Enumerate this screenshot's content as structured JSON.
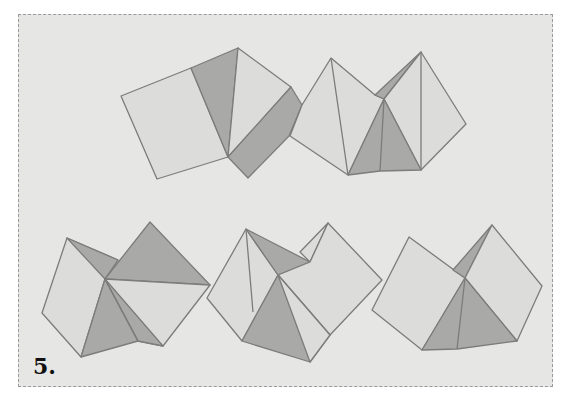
{
  "figure": {
    "label": "5.",
    "colors": {
      "background": "#e6e6e4",
      "paper_light": "#dcdcda",
      "paper_dark": "#a9a9a7",
      "edge": "#7c7c7a",
      "frame_border": "#9a9a9a"
    },
    "units": [
      {
        "id": "unit-1",
        "row": 1,
        "position": "top-left"
      },
      {
        "id": "unit-2",
        "row": 1,
        "position": "top-right"
      },
      {
        "id": "unit-3",
        "row": 2,
        "position": "bottom-left"
      },
      {
        "id": "unit-4",
        "row": 2,
        "position": "bottom-center"
      },
      {
        "id": "unit-5",
        "row": 2,
        "position": "bottom-right"
      }
    ]
  }
}
